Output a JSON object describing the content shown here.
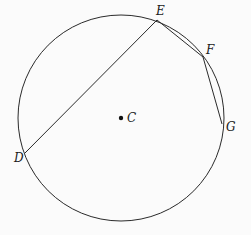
{
  "diagram": {
    "type": "circle-with-chords",
    "circle": {
      "center_label": "C",
      "cx": 121,
      "cy": 118,
      "r": 103
    },
    "points": [
      {
        "label": "E",
        "x": 157,
        "y": 20,
        "lx": 156,
        "ly": 15
      },
      {
        "label": "F",
        "x": 203,
        "y": 57,
        "lx": 206,
        "ly": 54
      },
      {
        "label": "G",
        "x": 222,
        "y": 124,
        "lx": 226,
        "ly": 131
      },
      {
        "label": "D",
        "x": 25,
        "y": 153,
        "lx": 14,
        "ly": 162
      }
    ],
    "center": {
      "label": "C",
      "x": 121,
      "y": 118,
      "lx": 127,
      "ly": 122
    },
    "segments": [
      {
        "from": "D",
        "to": "E"
      },
      {
        "from": "E",
        "to": "F"
      },
      {
        "from": "F",
        "to": "G"
      }
    ],
    "colors": {
      "stroke": "#2a2a2a",
      "background": "#fbfbfb"
    }
  }
}
